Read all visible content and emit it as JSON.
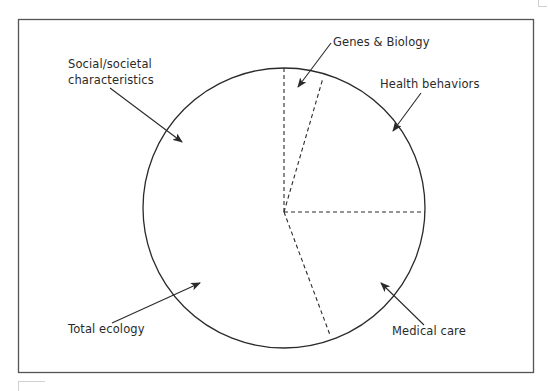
{
  "diagram": {
    "title": "",
    "type": "pie-circle-segments",
    "frame": {
      "x": 18,
      "y": 19,
      "width": 516,
      "height": 354,
      "stroke": "#555555"
    },
    "circle": {
      "cx": 284,
      "cy": 208,
      "r": 141,
      "stroke": "#2a2a2a"
    },
    "center": {
      "x": 284,
      "y": 212
    },
    "segments": [
      {
        "name": "Genes & Biology",
        "boundary_end": {
          "x": 284,
          "y": 68
        }
      },
      {
        "name": "Health behaviors",
        "boundary_end": {
          "x": 323,
          "y": 78
        }
      },
      {
        "name": "Medical care",
        "boundary_end": {
          "x": 425,
          "y": 212
        }
      },
      {
        "name": "Total ecology / Social-societal characteristics",
        "boundary_end": {
          "x": 330,
          "y": 335
        }
      }
    ],
    "labels": {
      "genes": "Genes & Biology",
      "health": "Health behaviors",
      "social_line1": "Social/societal",
      "social_line2": "characteristics",
      "ecology": "Total ecology",
      "medical": "Medical care"
    },
    "arrows": [
      {
        "name": "genes-arrow",
        "from": {
          "x": 331,
          "y": 43
        },
        "to": {
          "x": 298,
          "y": 87
        }
      },
      {
        "name": "health-arrow",
        "from": {
          "x": 421,
          "y": 93
        },
        "to": {
          "x": 393,
          "y": 131
        }
      },
      {
        "name": "social-arrow",
        "from": {
          "x": 110,
          "y": 88
        },
        "to": {
          "x": 182,
          "y": 142
        }
      },
      {
        "name": "ecology-arrow",
        "from": {
          "x": 112,
          "y": 323
        },
        "to": {
          "x": 200,
          "y": 283
        }
      },
      {
        "name": "medical-arrow",
        "from": {
          "x": 424,
          "y": 325
        },
        "to": {
          "x": 381,
          "y": 283
        }
      }
    ],
    "colors": {
      "line": "#2a2a2a",
      "frame": "#555555",
      "text": "#2a2a2a",
      "background": "#ffffff"
    }
  }
}
